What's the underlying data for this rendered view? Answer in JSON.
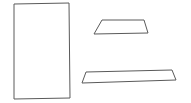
{
  "canvas": {
    "width": 191,
    "height": 103,
    "background": "#ffffff"
  },
  "stroke": {
    "color": "#5a5a5a",
    "width": 1
  },
  "shapes": [
    {
      "name": "tall-rectangle",
      "points": "14,4 69,3 70,98 14,99"
    },
    {
      "name": "upper-trapezoid",
      "points": "102,20 144,20 148,33 94,34"
    },
    {
      "name": "lower-trapezoid",
      "points": "86,72 172,70 176,80 82,83"
    }
  ]
}
